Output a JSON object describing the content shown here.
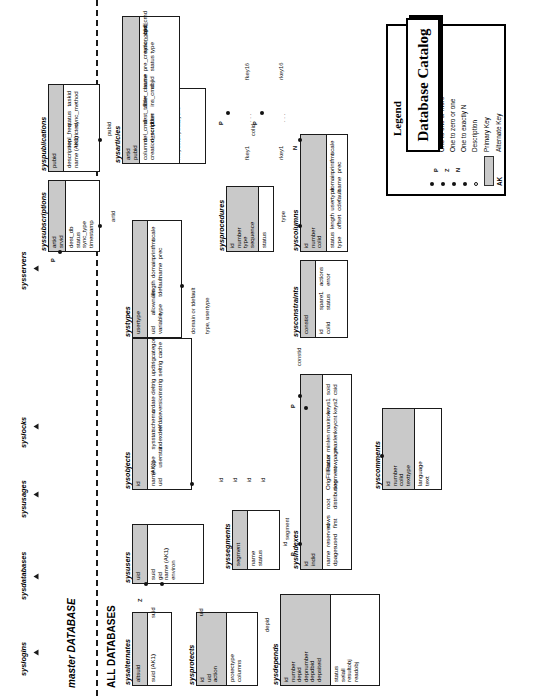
{
  "diagram": {
    "title": "Database Catalog",
    "banners": [
      {
        "id": "master",
        "text": "master DATABASE",
        "italic_part": "master"
      },
      {
        "id": "all",
        "text": "ALL DATABASES",
        "italic_part": ""
      }
    ]
  },
  "legend": {
    "title": "Legend",
    "rows": [
      {
        "symbol": "",
        "label": "One to zero or more"
      },
      {
        "symbol": "P",
        "label": "One to one or more"
      },
      {
        "symbol": "Z",
        "label": "One to zero or one"
      },
      {
        "symbol": "N",
        "label": "One to exactly N"
      },
      {
        "symbol": "",
        "label": "Description"
      },
      {
        "symbol": "",
        "label": "Primary Key"
      },
      {
        "symbol": "AK",
        "label": "Alternate Key"
      }
    ]
  },
  "external_entities": [
    {
      "name": "syslogins"
    },
    {
      "name": "sysdatabases"
    },
    {
      "name": "sysusages"
    },
    {
      "name": "syslocks"
    },
    {
      "name": "sysservers"
    }
  ],
  "entities": [
    {
      "id": "sysalternates",
      "name": "sysalternates",
      "keys": [
        "altsuid"
      ],
      "attrs": [
        "suid (AK1)"
      ]
    },
    {
      "id": "sysprotects",
      "name": "sysprotects",
      "keys": [
        "id",
        "uid",
        "action"
      ],
      "attrs": [
        "protectype",
        "columns"
      ]
    },
    {
      "id": "sysdepends",
      "name": "sysdepends",
      "keys": [
        "id",
        "number",
        "depid",
        "depnumber",
        "depdbid",
        "depsiteid"
      ],
      "attrs": [
        "status",
        "selall",
        "resultobj",
        "readobj"
      ]
    },
    {
      "id": "sysusers",
      "name": "sysusers",
      "keys": [
        "uid"
      ],
      "attrs": [
        "suid",
        "gid",
        "name (AK1)",
        "environ"
      ]
    },
    {
      "id": "syssegments",
      "name": "syssegments",
      "keys": [
        "segment"
      ],
      "attrs": [
        "name",
        "status"
      ]
    },
    {
      "id": "sysindexes",
      "name": "sysindexes",
      "keys": [
        "id",
        "indid"
      ],
      "attrs": [
        "name",
        "dpages",
        "reserved",
        "used",
        "rows",
        "first",
        "root",
        "distribution",
        "OrigFillFactor",
        "segment",
        "status",
        "rowpage",
        "minlen",
        "maxlen",
        "maxirow",
        "keycnt",
        "keys1",
        "keys2",
        "soid",
        "csid"
      ]
    },
    {
      "id": "sysobjects",
      "name": "sysobjects",
      "keys": [
        "id"
      ],
      "attrs": [
        "name",
        "uid",
        "type",
        "userstat",
        "sysstat",
        "indexdel",
        "schema",
        "refdate",
        "crdate",
        "version",
        "deltrig",
        "instrig",
        "updtrig",
        "seltrig",
        "category",
        "cache"
      ],
      "brace_note": "(AK1)"
    },
    {
      "id": "syscomments",
      "name": "syscomments",
      "keys": [
        "id",
        "number",
        "colid",
        "texttype"
      ],
      "attrs": [
        "language",
        "text"
      ]
    },
    {
      "id": "systypes",
      "name": "systypes",
      "keys": [
        "usertype"
      ],
      "attrs": [
        "uid",
        "variable",
        "allownulls",
        "type",
        "length",
        "tdefault",
        "domain",
        "name",
        "printfmt",
        "prec",
        "scale"
      ]
    },
    {
      "id": "sysconstraints",
      "name": "sysconstraints",
      "keys": [
        "constid"
      ],
      "attrs": [
        "id",
        "colid",
        "spare1",
        "status",
        "actions",
        "error"
      ]
    },
    {
      "id": "sysprocedures",
      "name": "sysprocedures",
      "keys": [
        "id",
        "number",
        "type",
        "sequence"
      ],
      "attrs": [
        "status"
      ]
    },
    {
      "id": "syscolumns",
      "name": "syscolumns",
      "keys": [
        "id",
        "number",
        "colid"
      ],
      "attrs": [
        "status",
        "type",
        "length",
        "offset",
        "usertype",
        "cdefault",
        "domain",
        "name",
        "printfmt",
        "prec",
        "scale"
      ]
    },
    {
      "id": "sysreferences",
      "name": "sysreferences",
      "keys": [
        "constid"
      ],
      "attrs": [
        "fkeyid",
        "fkeydbid",
        "rkeyid",
        "rkeydbid",
        "rkeyindid",
        "keycnt",
        "fkey1"
      ]
    },
    {
      "id": "syssubscriptions",
      "name": "syssubscriptions",
      "keys": [
        "artid",
        "srvid"
      ],
      "attrs": [
        "dest_db",
        "status",
        "sync_type",
        "timestamp"
      ]
    },
    {
      "id": "syspublications",
      "name": "syspublications",
      "keys": [
        "pubid"
      ],
      "attrs": [
        "description",
        "name (AK1)",
        "repl_freq",
        "restricted",
        "status",
        "sync_method",
        "taskid"
      ]
    },
    {
      "id": "sysarticles",
      "name": "sysarticles",
      "keys": [
        "artid",
        "pubid"
      ],
      "attrs": [
        "columns",
        "creation_script",
        "del_cmd",
        "description",
        "dest_table",
        "filter",
        "filter_clause",
        "ins_cmd",
        "name",
        "objid",
        "pre_creation_cmd",
        "status",
        "sync_objid",
        "type",
        "upd_cmd"
      ]
    }
  ],
  "fkey_fan": {
    "left_labels": [
      "fkey1",
      "fkey16"
    ],
    "right_labels": [
      "rkey1",
      "rkey16"
    ],
    "ellipsis": ". . ."
  },
  "relationship_labels": [
    "suid",
    "uid",
    "id",
    "depid",
    "segment",
    "artid",
    "pubid",
    "domain or tdefault",
    "type, usertype",
    "type",
    "colid",
    "cdefault or domain",
    "constid",
    "number"
  ]
}
